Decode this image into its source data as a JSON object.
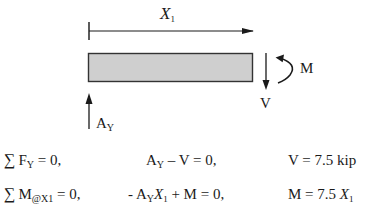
{
  "diagram": {
    "dimension": {
      "label_var": "X",
      "label_sub": "1"
    },
    "beam": {
      "fill": "#cfcfcf",
      "stroke": "#333333"
    },
    "forces": {
      "shear_label": "V",
      "moment_label": "M",
      "reaction_label_main": "A",
      "reaction_label_sub": "Y"
    }
  },
  "equations": [
    {
      "sum_symbol": "∑",
      "lhs_main": "F",
      "lhs_sub": "Y",
      "lhs_rest": " = 0,",
      "mid_parts": [
        "A",
        "Y",
        " – V = 0,"
      ],
      "result": "V = 7.5 kip"
    },
    {
      "sum_symbol": "∑",
      "lhs_main": "M",
      "lhs_sub": "@X1",
      "lhs_rest": " = 0,",
      "mid_parts": [
        "- A",
        "Y",
        "X",
        "1",
        " + M = 0,"
      ],
      "result_main": "M = 7.5 ",
      "result_var": "X",
      "result_sub": "1"
    }
  ]
}
